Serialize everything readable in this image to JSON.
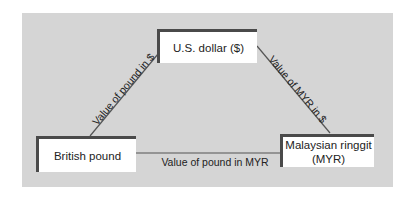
{
  "diagram": {
    "nodes": [
      {
        "id": "usd",
        "label": "U.S. dollar ($)"
      },
      {
        "id": "gbp",
        "label": "British pound"
      },
      {
        "id": "myr",
        "label_line1": "Malaysian ringgit",
        "label_line2": "(MYR)"
      }
    ],
    "edges": [
      {
        "from": "gbp",
        "to": "usd",
        "label": "Value of pound in $"
      },
      {
        "from": "usd",
        "to": "myr",
        "label": "Value of MYR in $"
      },
      {
        "from": "gbp",
        "to": "myr",
        "label": "Value of pound in MYR"
      }
    ]
  },
  "colors": {
    "panel": "#d5d5d5",
    "box_border": "#4a4a4a",
    "line": "#555555"
  }
}
